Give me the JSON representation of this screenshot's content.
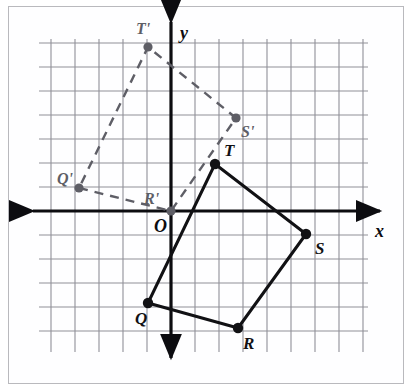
{
  "figure": {
    "type": "coordinate-plane-transformation",
    "background_color": "#ffffff",
    "border_color": "#b9b9bd",
    "grid_color": "#8f8f98",
    "axis_color": "#0c0c10",
    "solid_shape_color": "#111114",
    "dashed_shape_color": "#5e5e66"
  },
  "axes": {
    "x_label": "x",
    "y_label": "y",
    "origin_label": "O",
    "origin_px": {
      "x": 171,
      "y": 211
    },
    "grid_spacing_px": 24,
    "x_axis_y_px": 211,
    "y_axis_x_px": 171,
    "x_axis_start_px": 33,
    "x_axis_end_px": 380,
    "y_axis_start_px": 22,
    "y_axis_end_px": 358,
    "grid_left_px": 39,
    "grid_right_px": 368,
    "grid_top_px": 39,
    "grid_bottom_px": 352,
    "grid_columns": 14,
    "grid_rows": 14
  },
  "chart_data": {
    "type": "scatter",
    "title": "",
    "xlabel": "x",
    "ylabel": "y",
    "grid": true,
    "legend": "none",
    "xlim": [
      -5.5,
      8.2
    ],
    "ylim": [
      -7.2,
      7.2
    ],
    "series": [
      {
        "name": "Quadrilateral QRST",
        "style": "solid",
        "color": "#111114",
        "closed": true,
        "points": [
          {
            "label": "Q",
            "x": -1.0,
            "y": -3.8,
            "px": 148,
            "py": 303,
            "label_dx": -13,
            "label_dy": 21
          },
          {
            "label": "R",
            "x": 2.8,
            "y": -4.9,
            "px": 238,
            "py": 328,
            "label_dx": 5,
            "label_dy": 21
          },
          {
            "label": "S",
            "x": 5.6,
            "y": -0.95,
            "px": 306,
            "py": 234,
            "label_dx": 9,
            "label_dy": 20
          },
          {
            "label": "T",
            "x": 1.8,
            "y": 1.95,
            "px": 215,
            "py": 164,
            "label_dx": 9,
            "label_dy": -8
          }
        ]
      },
      {
        "name": "Quadrilateral Q'R'S'T'",
        "style": "dashed",
        "color": "#5e5e66",
        "closed": true,
        "points": [
          {
            "label": "Q'",
            "x": -3.8,
            "y": 0.95,
            "px": 79,
            "py": 188,
            "label_dx": -22,
            "label_dy": -4
          },
          {
            "label": "R'",
            "x": 0.0,
            "y": 0.0,
            "px": 171,
            "py": 211,
            "label_dx": -27,
            "label_dy": -7
          },
          {
            "label": "S'",
            "x": 2.7,
            "y": 3.9,
            "px": 236,
            "py": 118,
            "label_dx": 5,
            "label_dy": 19
          },
          {
            "label": "T'",
            "x": -1.0,
            "y": 6.8,
            "px": 148,
            "py": 47,
            "label_dx": -12,
            "label_dy": -13
          }
        ]
      }
    ]
  }
}
